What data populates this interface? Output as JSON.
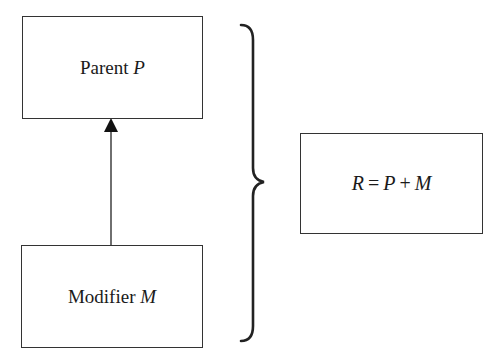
{
  "diagram": {
    "nodes": {
      "parent": {
        "label": "Parent",
        "symbol": "P"
      },
      "modifier": {
        "label": "Modifier",
        "symbol": "M"
      },
      "result": {
        "lhs": "R",
        "eq": "=",
        "p": "P",
        "plus": "+",
        "m": "M"
      }
    },
    "edges": [
      {
        "from": "modifier",
        "to": "parent",
        "style": "solid-arrow"
      }
    ],
    "grouping": {
      "type": "curly-brace",
      "groups": [
        "parent",
        "modifier"
      ],
      "points_to": "result"
    },
    "colors": {
      "stroke": "#333333",
      "background": "#ffffff",
      "text": "#1a1a1a"
    }
  }
}
